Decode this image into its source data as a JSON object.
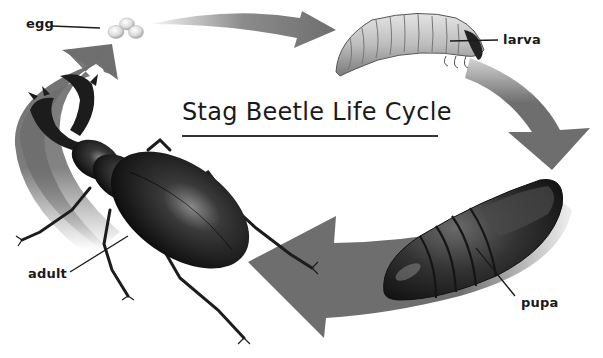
{
  "diagram": {
    "title": "Stag Beetle Life Cycle",
    "stages": [
      {
        "id": "egg",
        "label": "egg"
      },
      {
        "id": "larva",
        "label": "larva"
      },
      {
        "id": "pupa",
        "label": "pupa"
      },
      {
        "id": "adult",
        "label": "adult"
      }
    ],
    "cycle_order": [
      "egg",
      "larva",
      "pupa",
      "adult",
      "egg"
    ],
    "colors": {
      "arrow": "#6e6e6e",
      "background": "#ffffff",
      "text": "#1a1a1a",
      "beetle": "#1c1c1c"
    }
  }
}
